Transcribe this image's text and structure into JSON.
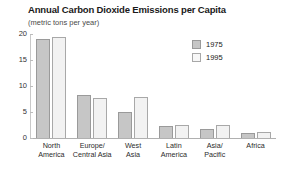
{
  "chart_data": {
    "type": "bar",
    "title": "Annual Carbon Dioxide Emissions per Capita",
    "subtitle": "(metric tons per year)",
    "xlabel": "",
    "ylabel": "",
    "ylim": [
      0,
      20
    ],
    "yticks": [
      0,
      5,
      10,
      15,
      20
    ],
    "ytick_labels": [
      "0",
      "5",
      "10",
      "15",
      "20"
    ],
    "grid": false,
    "legend_position": "upper-right",
    "categories": [
      "North\nAmerica",
      "Europe/\nCentral Asia",
      "West\nAsia",
      "Latin\nAmerica",
      "Asia/\nPacific",
      "Africa"
    ],
    "series": [
      {
        "name": "1975",
        "color": "#c6c6c6",
        "values": [
          19.0,
          8.3,
          5.0,
          2.3,
          1.8,
          1.0
        ]
      },
      {
        "name": "1995",
        "color": "#f2f2f2",
        "values": [
          19.5,
          7.6,
          7.8,
          2.5,
          2.5,
          1.1
        ]
      }
    ]
  },
  "legend": {
    "items": [
      {
        "label": "1975"
      },
      {
        "label": "1995"
      }
    ]
  }
}
